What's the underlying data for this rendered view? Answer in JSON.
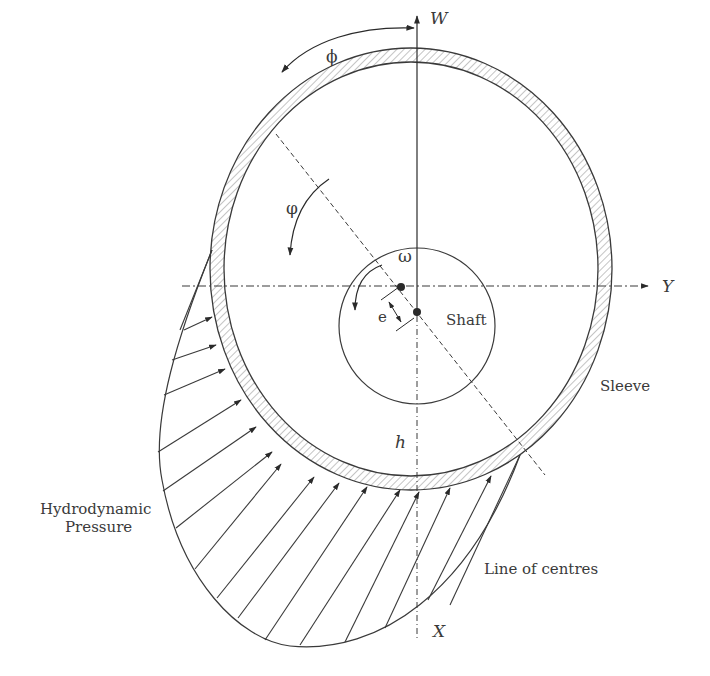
{
  "figure": {
    "colors": {
      "stroke": "#3a3a3a",
      "hatch": "#8a8a8a",
      "background": "#ffffff"
    }
  },
  "labels": {
    "load_axis": "W",
    "horizontal_axis": "Y",
    "vertical_axis_bottom": "X",
    "attitude_angle": "ϕ",
    "angular_coordinate": "φ",
    "angular_velocity": "ω",
    "eccentricity": "e",
    "film_thickness": "h",
    "shaft": "Shaft",
    "sleeve": "Sleeve",
    "pressure_line1": "Hydrodynamic",
    "pressure_line2": "Pressure",
    "line_of_centres": "Line of centres"
  },
  "geometry": {
    "sleeve_center": [
      411,
      269
    ],
    "sleeve_outer_radius": [
      201,
      221
    ],
    "sleeve_inner_radius": [
      187,
      207
    ],
    "shaft_center": [
      417,
      316
    ],
    "shaft_radius": 78,
    "bearing_center_point": [
      401,
      286
    ],
    "pressure_arrow_count": 15
  }
}
